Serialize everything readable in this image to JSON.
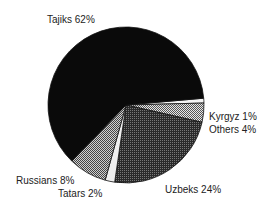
{
  "chart_data": {
    "type": "pie",
    "title": "",
    "center": [
      126,
      105
    ],
    "radius": 78,
    "slices": [
      {
        "label": "Tajiks",
        "value": 62,
        "text": "Tajiks 62%",
        "fill": "#0a0a0a",
        "pattern": "solid",
        "label_pos": [
          47,
          14
        ]
      },
      {
        "label": "Kyrgyz",
        "value": 1,
        "text": "Kyrgyz 1%",
        "fill": "#f4f4f4",
        "pattern": "solid",
        "label_pos": [
          209,
          111
        ]
      },
      {
        "label": "Others",
        "value": 4,
        "text": "Others 4%",
        "fill": "#b8b8b8",
        "pattern": "fine-check",
        "label_pos": [
          209,
          124
        ]
      },
      {
        "label": "Uzbeks",
        "value": 24,
        "text": "Uzbeks 24%",
        "fill": "#4a4a4a",
        "pattern": "dark-dither",
        "label_pos": [
          165,
          184
        ]
      },
      {
        "label": "Tatars",
        "value": 2,
        "text": "Tatars 2%",
        "fill": "#eeeeee",
        "pattern": "solid",
        "label_pos": [
          58,
          188
        ]
      },
      {
        "label": "Russians",
        "value": 8,
        "text": "Russians 8%",
        "fill": "#9a9a9a",
        "pattern": "check",
        "label_pos": [
          16,
          175
        ]
      }
    ],
    "start_angle_deg": -5,
    "direction": "clockwise",
    "legend": "none"
  }
}
